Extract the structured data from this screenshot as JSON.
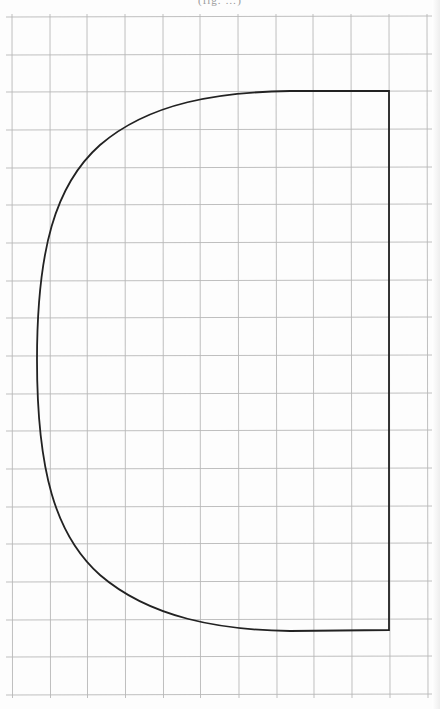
{
  "page": {
    "header_partial": "(fig. …)"
  },
  "grid": {
    "columns": 11,
    "rows": 18,
    "x_lines": [
      12,
      50,
      87,
      125,
      163,
      200,
      238,
      276,
      313,
      351,
      389,
      427
    ],
    "y_lines": [
      17,
      55,
      92,
      130,
      168,
      205,
      243,
      281,
      318,
      356,
      394,
      431,
      469,
      507,
      544,
      582,
      620,
      657,
      695
    ],
    "line_color": "#b8b8b8"
  },
  "shape": {
    "name": "pattern-piece",
    "stroke_color": "#222222",
    "stroke_width": 1.8,
    "path": "M389,91 L389,630 L290,631 C220,630 150,618 100,575 C55,535 37,470 37,360 C37,250 55,185 100,145 C150,102 220,92 290,91 Z"
  }
}
